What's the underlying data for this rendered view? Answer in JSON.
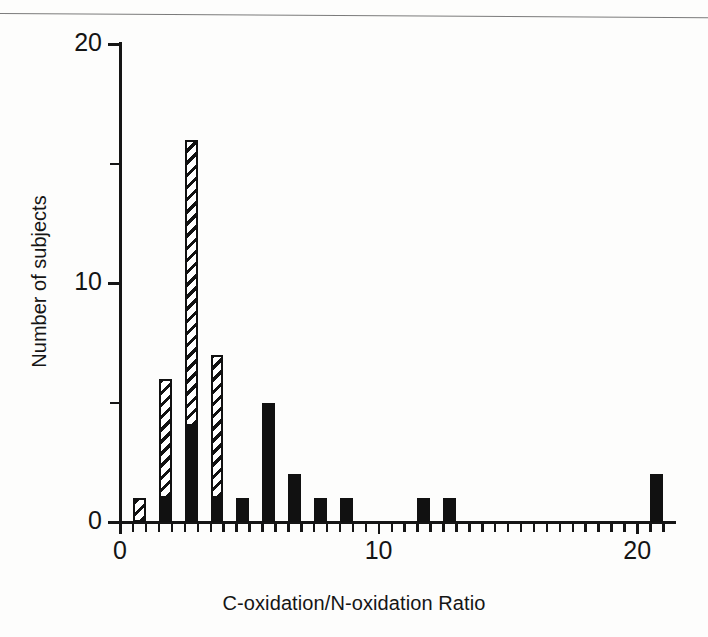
{
  "figure": {
    "top_rule": true
  },
  "chart_data": {
    "type": "bar",
    "title": "",
    "subtitle": "",
    "xlabel": "C-oxidation/N-oxidation Ratio",
    "ylabel": "Number of subjects",
    "xlim": [
      0,
      21.5
    ],
    "ylim": [
      0,
      20
    ],
    "bin_width": 0.5,
    "grid": false,
    "legend": null,
    "stacked": true,
    "x_tick_labels": [
      "0",
      "10",
      "20"
    ],
    "x_tick_values": [
      0,
      10,
      20
    ],
    "x_minor_tick_values": [
      0.5,
      1,
      1.5,
      2,
      2.5,
      3,
      3.5,
      4,
      4.5,
      5,
      5.5,
      6,
      6.5,
      7,
      7.5,
      8,
      8.5,
      9,
      9.5,
      10.5,
      11,
      11.5,
      12,
      12.5,
      13,
      13.5,
      14,
      14.5,
      15,
      15.5,
      16,
      16.5,
      17,
      17.5,
      18,
      18.5,
      19,
      19.5,
      20.5,
      21
    ],
    "y_tick_labels": [
      "0",
      "10",
      "20"
    ],
    "y_tick_values": [
      0,
      10,
      20
    ],
    "y_minor_tick_values": [
      5,
      15
    ],
    "series": [
      {
        "name": "solid",
        "style": "filled-black",
        "color": "#111111",
        "values": [
          0,
          1,
          4,
          1,
          1,
          5,
          2,
          1,
          1,
          0,
          0,
          1,
          1,
          0,
          0,
          0,
          0,
          0,
          0,
          0,
          2
        ]
      },
      {
        "name": "hatched",
        "style": "diagonal-hatch",
        "color": "#111111",
        "values": [
          1,
          5,
          12,
          6,
          0,
          0,
          0,
          0,
          0,
          0,
          0,
          0,
          0,
          0,
          0,
          0,
          0,
          0,
          0,
          0,
          0
        ]
      }
    ],
    "bins": [
      {
        "x0": 0.5,
        "solid": 0,
        "hatched": 1,
        "total": 1
      },
      {
        "x0": 1.5,
        "solid": 1,
        "hatched": 5,
        "total": 6
      },
      {
        "x0": 2.5,
        "solid": 4,
        "hatched": 12,
        "total": 16
      },
      {
        "x0": 3.5,
        "solid": 1,
        "hatched": 6,
        "total": 7
      },
      {
        "x0": 4.5,
        "solid": 1,
        "hatched": 0,
        "total": 1
      },
      {
        "x0": 5.5,
        "solid": 5,
        "hatched": 0,
        "total": 5
      },
      {
        "x0": 6.5,
        "solid": 2,
        "hatched": 0,
        "total": 2
      },
      {
        "x0": 7.5,
        "solid": 1,
        "hatched": 0,
        "total": 1
      },
      {
        "x0": 8.5,
        "solid": 1,
        "hatched": 0,
        "total": 1
      },
      {
        "x0": 11.5,
        "solid": 1,
        "hatched": 0,
        "total": 1
      },
      {
        "x0": 12.5,
        "solid": 1,
        "hatched": 0,
        "total": 1
      },
      {
        "x0": 20.5,
        "solid": 2,
        "hatched": 0,
        "total": 2
      }
    ]
  }
}
